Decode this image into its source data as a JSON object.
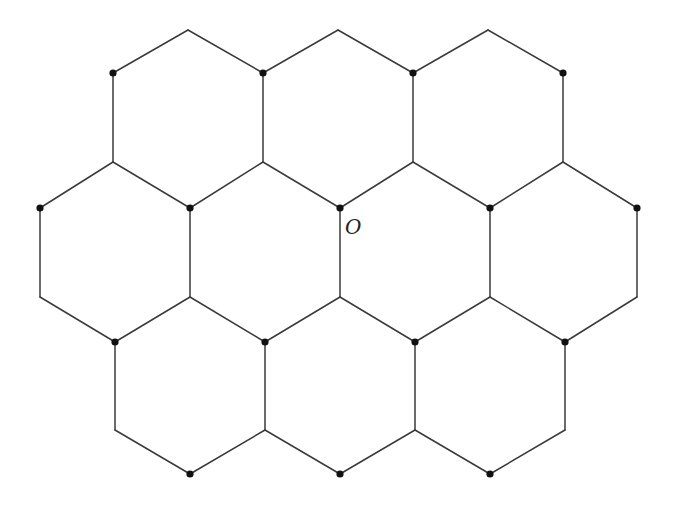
{
  "diagram": {
    "origin_label": "O",
    "colors": {
      "edge": "#3a3a3a",
      "node": "#111111"
    },
    "vertices": {
      "t1": [
        188,
        30
      ],
      "t2": [
        338,
        30
      ],
      "t3": [
        488,
        30
      ],
      "a1": [
        113,
        73
      ],
      "a2": [
        263,
        73
      ],
      "a3": [
        413,
        73
      ],
      "a4": [
        563,
        73
      ],
      "b1": [
        113,
        162
      ],
      "b2": [
        263,
        162
      ],
      "b3": [
        413,
        162
      ],
      "b4": [
        563,
        162
      ],
      "c1": [
        40,
        208
      ],
      "c2": [
        190,
        208
      ],
      "c3": [
        340,
        208
      ],
      "c4": [
        490,
        208
      ],
      "c5": [
        637,
        208
      ],
      "d1": [
        40,
        297
      ],
      "d2": [
        190,
        297
      ],
      "d3": [
        340,
        297
      ],
      "d4": [
        490,
        297
      ],
      "d5": [
        637,
        297
      ],
      "e1": [
        115,
        342
      ],
      "e2": [
        265,
        342
      ],
      "e3": [
        415,
        342
      ],
      "e4": [
        565,
        342
      ],
      "f1": [
        115,
        430
      ],
      "f2": [
        265,
        430
      ],
      "f3": [
        415,
        430
      ],
      "f4": [
        565,
        430
      ],
      "g1": [
        190,
        474
      ],
      "g2": [
        340,
        474
      ],
      "g3": [
        490,
        474
      ]
    },
    "edges": [
      [
        "a1",
        "t1"
      ],
      [
        "t1",
        "a2"
      ],
      [
        "a2",
        "t2"
      ],
      [
        "t2",
        "a3"
      ],
      [
        "a3",
        "t3"
      ],
      [
        "t3",
        "a4"
      ],
      [
        "a1",
        "b1"
      ],
      [
        "a2",
        "b2"
      ],
      [
        "a3",
        "b3"
      ],
      [
        "a4",
        "b4"
      ],
      [
        "b1",
        "c1"
      ],
      [
        "b1",
        "c2"
      ],
      [
        "b2",
        "c2"
      ],
      [
        "b2",
        "c3"
      ],
      [
        "b3",
        "c3"
      ],
      [
        "b3",
        "c4"
      ],
      [
        "b4",
        "c4"
      ],
      [
        "b4",
        "c5"
      ],
      [
        "c1",
        "d1"
      ],
      [
        "c2",
        "d2"
      ],
      [
        "c3",
        "d3"
      ],
      [
        "c4",
        "d4"
      ],
      [
        "c5",
        "d5"
      ],
      [
        "d1",
        "e1"
      ],
      [
        "d2",
        "e1"
      ],
      [
        "d2",
        "e2"
      ],
      [
        "d3",
        "e2"
      ],
      [
        "d3",
        "e3"
      ],
      [
        "d4",
        "e3"
      ],
      [
        "d4",
        "e4"
      ],
      [
        "d5",
        "e4"
      ],
      [
        "e1",
        "f1"
      ],
      [
        "e2",
        "f2"
      ],
      [
        "e3",
        "f3"
      ],
      [
        "e4",
        "f4"
      ],
      [
        "f1",
        "g1"
      ],
      [
        "g1",
        "f2"
      ],
      [
        "f2",
        "g2"
      ],
      [
        "g2",
        "f3"
      ],
      [
        "f3",
        "g3"
      ],
      [
        "g3",
        "f4"
      ]
    ],
    "marked_nodes": [
      "a1",
      "a2",
      "a3",
      "a4",
      "c1",
      "c2",
      "c3",
      "c4",
      "c5",
      "e1",
      "e2",
      "e3",
      "e4",
      "g1",
      "g2",
      "g3"
    ],
    "origin_node": "c3",
    "label_position": [
      345,
      234
    ]
  }
}
